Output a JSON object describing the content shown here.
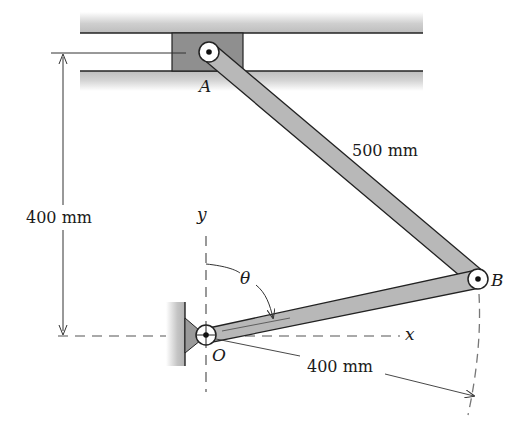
{
  "diagram": {
    "type": "mechanism",
    "points": {
      "A": {
        "label": "A"
      },
      "B": {
        "label": "B"
      },
      "O": {
        "label": "O"
      }
    },
    "axes": {
      "x_label": "x",
      "y_label": "y"
    },
    "angle_label": "θ",
    "dimensions": {
      "vertical_offset": "400 mm",
      "link_AB": "500 mm",
      "crank_OB": "400 mm"
    },
    "colors": {
      "link_fill": "#b8b8b8",
      "slider_fill": "#8f8f8f",
      "rail_gradient": "#c8c8c8",
      "line": "#222222",
      "dashed": "#555555"
    }
  }
}
